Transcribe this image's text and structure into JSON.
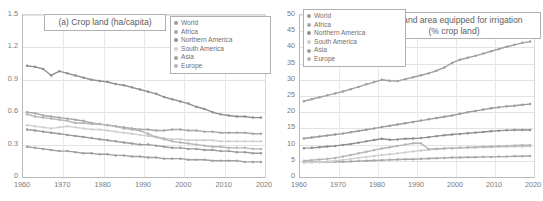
{
  "figure": {
    "width": 543,
    "height": 201,
    "background": "#ffffff",
    "gridline_color": "#e3e3e3",
    "axis_color": "#b9b9b9",
    "tick_color": "#7a7a7a"
  },
  "series_colors": {
    "World": "#9b9b9b",
    "Africa": "#a7a7a7",
    "Northern America": "#8f8f8f",
    "South America": "#cfcfcf",
    "Asia": "#a0a0a0",
    "Europe": "#b5b5b5"
  },
  "legend": {
    "entries": [
      "World",
      "Africa",
      "Northern America",
      "South America",
      "Asia",
      "Europe"
    ]
  },
  "chart_data": [
    {
      "id": "panel-a",
      "type": "line",
      "title": "(a) Crop land (ha/capita)",
      "title_lines": [
        "(a) Crop land (ha/capita)"
      ],
      "xlabel": "",
      "ylabel": "",
      "xlim": [
        1960,
        2020
      ],
      "ylim": [
        0,
        1.5
      ],
      "ytick_values": [
        0,
        0.3,
        0.6,
        0.9,
        1.2,
        1.5
      ],
      "ytick_labels": [
        "0",
        "0.3",
        "0.6",
        "0.9",
        "1.2",
        "1.5"
      ],
      "xtick_values": [
        1960,
        1970,
        1980,
        1990,
        2000,
        2010,
        2020
      ],
      "xtick_labels": [
        "1960",
        "1970",
        "1980",
        "1990",
        "2000",
        "2010",
        "2020"
      ],
      "grid": true,
      "legend_position": "top-right",
      "x": [
        1961,
        1963,
        1965,
        1967,
        1969,
        1971,
        1973,
        1975,
        1977,
        1979,
        1981,
        1983,
        1985,
        1987,
        1989,
        1991,
        1993,
        1995,
        1997,
        1999,
        2001,
        2003,
        2005,
        2007,
        2009,
        2011,
        2013,
        2015,
        2017,
        2019
      ],
      "series": [
        {
          "name": "World",
          "values": [
            0.44,
            0.43,
            0.42,
            0.41,
            0.4,
            0.39,
            0.38,
            0.37,
            0.36,
            0.35,
            0.34,
            0.33,
            0.32,
            0.31,
            0.3,
            0.3,
            0.29,
            0.28,
            0.27,
            0.27,
            0.26,
            0.26,
            0.25,
            0.25,
            0.24,
            0.24,
            0.23,
            0.23,
            0.22,
            0.22
          ]
        },
        {
          "name": "Africa",
          "values": [
            0.6,
            0.59,
            0.57,
            0.56,
            0.55,
            0.54,
            0.53,
            0.52,
            0.5,
            0.49,
            0.48,
            0.47,
            0.46,
            0.45,
            0.44,
            0.44,
            0.43,
            0.43,
            0.44,
            0.44,
            0.43,
            0.43,
            0.42,
            0.42,
            0.41,
            0.41,
            0.41,
            0.41,
            0.4,
            0.4
          ]
        },
        {
          "name": "Northern America",
          "values": [
            1.03,
            1.02,
            1.0,
            0.94,
            0.98,
            0.96,
            0.94,
            0.92,
            0.9,
            0.89,
            0.88,
            0.86,
            0.85,
            0.83,
            0.81,
            0.79,
            0.77,
            0.74,
            0.72,
            0.7,
            0.68,
            0.65,
            0.63,
            0.6,
            0.58,
            0.57,
            0.56,
            0.56,
            0.55,
            0.55
          ]
        },
        {
          "name": "South America",
          "values": [
            0.48,
            0.47,
            0.46,
            0.45,
            0.46,
            0.47,
            0.46,
            0.45,
            0.44,
            0.44,
            0.43,
            0.42,
            0.41,
            0.4,
            0.39,
            0.38,
            0.37,
            0.36,
            0.35,
            0.35,
            0.34,
            0.34,
            0.34,
            0.34,
            0.33,
            0.33,
            0.33,
            0.33,
            0.33,
            0.33
          ]
        },
        {
          "name": "Asia",
          "values": [
            0.28,
            0.27,
            0.26,
            0.25,
            0.24,
            0.24,
            0.23,
            0.22,
            0.22,
            0.21,
            0.21,
            0.2,
            0.2,
            0.19,
            0.19,
            0.18,
            0.18,
            0.17,
            0.17,
            0.17,
            0.16,
            0.16,
            0.16,
            0.15,
            0.15,
            0.15,
            0.15,
            0.14,
            0.14,
            0.14
          ]
        },
        {
          "name": "Europe",
          "values": [
            0.58,
            0.56,
            0.55,
            0.54,
            0.53,
            0.52,
            0.5,
            0.5,
            0.49,
            0.49,
            0.48,
            0.47,
            0.45,
            0.44,
            0.43,
            0.4,
            0.37,
            0.35,
            0.33,
            0.32,
            0.31,
            0.3,
            0.29,
            0.28,
            0.28,
            0.27,
            0.27,
            0.27,
            0.26,
            0.26
          ]
        }
      ]
    },
    {
      "id": "panel-b",
      "type": "line",
      "title": "(b) Land area equipped for irrigation (% crop land)",
      "title_lines": [
        "(b) Land area equipped for irrigation",
        "(% crop land)"
      ],
      "xlabel": "",
      "ylabel": "",
      "xlim": [
        1960,
        2020
      ],
      "ylim": [
        0,
        50
      ],
      "ytick_values": [
        0,
        5,
        10,
        15,
        20,
        25,
        30,
        35,
        40,
        45,
        50
      ],
      "ytick_labels": [
        "0",
        "5",
        "10",
        "15",
        "20",
        "25",
        "30",
        "35",
        "40",
        "45",
        "50"
      ],
      "xtick_values": [
        1960,
        1970,
        1980,
        1990,
        2000,
        2010,
        2020
      ],
      "xtick_labels": [
        "1960",
        "1970",
        "1980",
        "1990",
        "2000",
        "2010",
        "2020"
      ],
      "grid": true,
      "legend_position": "top-left",
      "x": [
        1961,
        1963,
        1965,
        1967,
        1969,
        1971,
        1973,
        1975,
        1977,
        1979,
        1981,
        1983,
        1985,
        1987,
        1989,
        1991,
        1993,
        1995,
        1997,
        1999,
        2001,
        2003,
        2005,
        2007,
        2009,
        2011,
        2013,
        2015,
        2017,
        2019
      ],
      "series": [
        {
          "name": "World",
          "values": [
            11.9,
            12.2,
            12.5,
            12.8,
            13.1,
            13.4,
            13.8,
            14.2,
            14.6,
            15.0,
            15.4,
            15.8,
            16.2,
            16.6,
            17.0,
            17.4,
            17.8,
            18.2,
            18.6,
            19.0,
            19.5,
            20.0,
            20.4,
            20.8,
            21.2,
            21.5,
            21.8,
            22.0,
            22.3,
            22.5
          ]
        },
        {
          "name": "Africa",
          "values": [
            4.6,
            4.6,
            4.6,
            4.6,
            4.7,
            4.7,
            4.8,
            4.9,
            5.0,
            5.1,
            5.2,
            5.3,
            5.4,
            5.5,
            5.5,
            5.6,
            5.7,
            5.8,
            5.9,
            6.0,
            6.0,
            6.1,
            6.1,
            6.2,
            6.2,
            6.3,
            6.3,
            6.4,
            6.4,
            6.5
          ]
        },
        {
          "name": "Northern America",
          "values": [
            8.9,
            9.0,
            9.2,
            9.4,
            9.6,
            9.9,
            10.2,
            10.6,
            11.0,
            11.4,
            11.8,
            11.5,
            11.6,
            11.8,
            11.9,
            12.0,
            12.3,
            12.6,
            12.9,
            13.1,
            13.3,
            13.5,
            13.7,
            13.9,
            14.1,
            14.3,
            14.4,
            14.5,
            14.5,
            14.5
          ]
        },
        {
          "name": "South America",
          "values": [
            4.4,
            4.5,
            4.6,
            4.8,
            5.0,
            5.3,
            5.6,
            5.9,
            6.2,
            6.5,
            6.8,
            7.0,
            7.3,
            7.6,
            7.9,
            8.2,
            8.4,
            8.6,
            8.8,
            8.9,
            9.0,
            9.1,
            9.1,
            9.2,
            9.2,
            9.3,
            9.3,
            9.4,
            9.4,
            9.5
          ]
        },
        {
          "name": "Asia",
          "values": [
            23.4,
            24.0,
            24.6,
            25.2,
            25.8,
            26.4,
            27.1,
            27.8,
            28.6,
            29.3,
            30.0,
            29.7,
            29.6,
            30.2,
            30.8,
            31.4,
            32.0,
            32.8,
            33.8,
            35.2,
            36.2,
            36.8,
            37.4,
            38.1,
            38.8,
            39.5,
            40.2,
            40.8,
            41.4,
            41.8
          ]
        },
        {
          "name": "Europe",
          "values": [
            5.0,
            5.2,
            5.4,
            5.6,
            5.9,
            6.3,
            6.8,
            7.3,
            7.8,
            8.3,
            8.8,
            9.2,
            9.6,
            10.0,
            10.4,
            10.4,
            8.6,
            8.7,
            8.8,
            8.9,
            9.0,
            9.1,
            9.2,
            9.3,
            9.4,
            9.5,
            9.6,
            9.7,
            9.8,
            9.8
          ]
        }
      ]
    }
  ]
}
